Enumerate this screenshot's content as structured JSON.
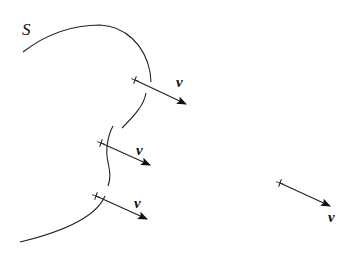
{
  "diagram": {
    "surface_label": "S",
    "vector_label": "v",
    "points": [
      {
        "id": "p1",
        "x": 135,
        "y": 80,
        "tip_x": 186,
        "tip_y": 104,
        "label_x": 177,
        "label_y": 85
      },
      {
        "id": "p2",
        "x": 101,
        "y": 143,
        "tip_x": 150,
        "tip_y": 165,
        "label_x": 137,
        "label_y": 153
      },
      {
        "id": "p3",
        "x": 96,
        "y": 196,
        "tip_x": 147,
        "tip_y": 219,
        "label_x": 135,
        "label_y": 205
      },
      {
        "id": "p4",
        "x": 280,
        "y": 183,
        "tip_x": 330,
        "tip_y": 206,
        "label_x": 329,
        "label_y": 220
      }
    ],
    "colors": {
      "stroke": "#222222"
    }
  }
}
